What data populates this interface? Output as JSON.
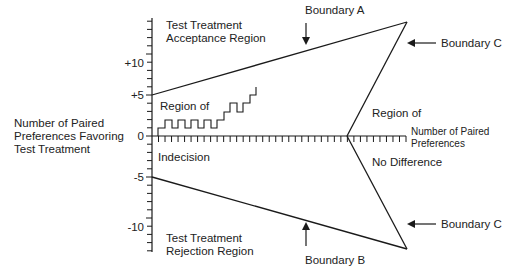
{
  "diagram": {
    "y_axis": {
      "title_lines": [
        "Number of Paired",
        "Preferences Favoring",
        "Test Treatment"
      ],
      "tick_labels": [
        {
          "text": "+10",
          "value": 10
        },
        {
          "text": "+5",
          "value": 5
        },
        {
          "text": "0",
          "value": 0
        },
        {
          "text": "-5",
          "value": -5
        },
        {
          "text": "-10",
          "value": -10
        }
      ],
      "range": [
        -14,
        14
      ]
    },
    "x_axis": {
      "title_lines": [
        "Number of Paired",
        "Preferences"
      ],
      "tick_count": 39
    },
    "regions": {
      "acceptance": [
        "Test Treatment",
        "Acceptance Region"
      ],
      "rejection": [
        "Test Treatment",
        "Rejection Region"
      ],
      "indecision_top": "Region of",
      "indecision_bottom": "Indecision",
      "no_difference_top": "Region of",
      "no_difference_bottom": "No Difference"
    },
    "boundaries": {
      "a": "Boundary A",
      "b": "Boundary B",
      "c_top": "Boundary C",
      "c_bottom": "Boundary C"
    },
    "colors": {
      "line": "#1a1a1a",
      "text": "#222222",
      "background": "#ffffff"
    }
  }
}
